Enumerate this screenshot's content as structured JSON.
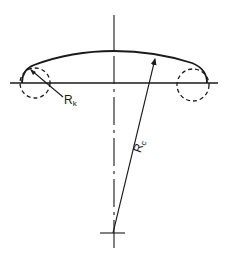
{
  "diagram": {
    "type": "torispherical-head-cross-section",
    "stroke_color": "#1a1a1a",
    "labels": {
      "knuckle_radius": {
        "main": "R",
        "sub": "k"
      },
      "crown_radius": {
        "main": "R",
        "sub": "c"
      }
    },
    "elements": {
      "vertical_centerline": true,
      "horizontal_baseline": true,
      "dome_profile": true,
      "knuckle_circles_dashed": 2,
      "crown_radius_arrow": true,
      "crown_center_crosshair": true
    }
  }
}
